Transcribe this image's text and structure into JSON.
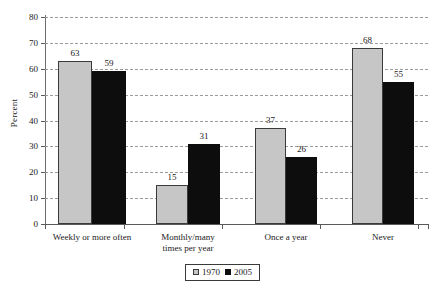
{
  "chart_data": {
    "type": "bar",
    "title": "",
    "subtitle": "",
    "xlabel": "",
    "ylabel": "Percent",
    "ylim": [
      0,
      80
    ],
    "ytick_interval": 10,
    "yticks": [
      0,
      10,
      20,
      30,
      40,
      50,
      60,
      70,
      80
    ],
    "grid": true,
    "grid_style": "dashed-horizontal",
    "legend_position": "bottom-center",
    "categories": [
      "Weekly or more often",
      "Monthly/many times per year",
      "Once a year",
      "Never"
    ],
    "category_lines": [
      [
        "Weekly or more often"
      ],
      [
        "Monthly/many",
        "times per year"
      ],
      [
        "Once a year"
      ],
      [
        "Never"
      ]
    ],
    "series": [
      {
        "name": "1970",
        "color": "#c6c6c6",
        "values": [
          63,
          15,
          37,
          68
        ]
      },
      {
        "name": "2005",
        "color": "#0d0d0d",
        "values": [
          59,
          31,
          26,
          55
        ]
      }
    ],
    "data_labels": [
      {
        "category": "Weekly or more often",
        "series": "1970",
        "value": 63
      },
      {
        "category": "Weekly or more often",
        "series": "2005",
        "value": 59
      },
      {
        "category": "Monthly/many times per year",
        "series": "1970",
        "value": 15
      },
      {
        "category": "Monthly/many times per year",
        "series": "2005",
        "value": 31
      },
      {
        "category": "Once a year",
        "series": "1970",
        "value": 37
      },
      {
        "category": "Once a year",
        "series": "2005",
        "value": 26
      },
      {
        "category": "Never",
        "series": "1970",
        "value": 68
      },
      {
        "category": "Never",
        "series": "2005",
        "value": 55
      }
    ]
  },
  "axis": {
    "y_title": "Percent",
    "y_tick_labels": [
      "0",
      "10",
      "20",
      "30",
      "40",
      "50",
      "60",
      "70",
      "80"
    ]
  },
  "legend": {
    "items": [
      {
        "label": "1970",
        "color": "#c6c6c6"
      },
      {
        "label": "2005",
        "color": "#0d0d0d"
      }
    ]
  },
  "colors": {
    "series_1970": "#c6c6c6",
    "series_2005": "#0d0d0d",
    "gridline": "#9b9b9b",
    "axis": "#5a5a5a",
    "background": "#ffffff",
    "text": "#1a1a1a"
  }
}
